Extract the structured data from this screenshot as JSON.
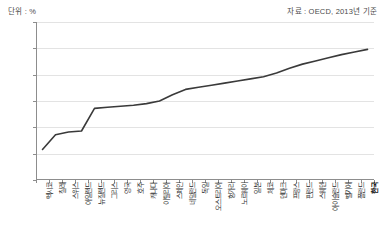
{
  "header": {
    "unit_label": "단위 : %",
    "source_label": "자료 : OECD, 2013년 기준"
  },
  "chart_data": {
    "type": "line",
    "title": "",
    "subtitle": "",
    "xlabel": "",
    "ylabel": "단위 : %",
    "ylim": [
      0.0,
      30.0
    ],
    "yticks": [
      "0.0",
      "5.0",
      "10.0",
      "15.0",
      "20.0",
      "25.0",
      "30.0"
    ],
    "ytick_values": [
      0.0,
      5.0,
      10.0,
      15.0,
      20.0,
      25.0,
      30.0
    ],
    "grid": true,
    "legend": false,
    "legend_position": "none",
    "line_color": "#3a3a3a",
    "categories": [
      "멕시코",
      "칠레",
      "스위스",
      "아일랜드",
      "뉴질랜드",
      "그리스",
      "영국",
      "호주",
      "캐나다",
      "이탈리아",
      "스페인",
      "네덜란드",
      "독일",
      "오스트리아",
      "헝가리",
      "노르웨이",
      "일본",
      "체코",
      "덴마크",
      "프랑스",
      "핀란드",
      "스웨덴",
      "아이슬란드",
      "벨기에",
      "폴란드",
      "한국"
    ],
    "values": [
      5.8,
      8.6,
      9.1,
      9.3,
      13.6,
      13.8,
      14.0,
      14.2,
      14.5,
      15.0,
      16.2,
      17.2,
      17.6,
      18.0,
      18.4,
      18.8,
      19.2,
      19.6,
      20.3,
      21.2,
      22.0,
      22.6,
      23.2,
      23.8,
      24.3,
      24.8
    ],
    "highlight_category": "한국",
    "highlight_value": 24.8
  }
}
